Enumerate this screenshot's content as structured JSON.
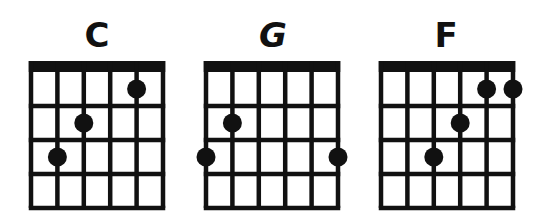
{
  "chords": [
    {
      "name": "C",
      "dots": [
        {
          "string": 4,
          "fret": 1
        },
        {
          "string": 2,
          "fret": 2
        },
        {
          "string": 1,
          "fret": 3
        }
      ]
    },
    {
      "name": "G",
      "dots": [
        {
          "string": 1,
          "fret": 2
        },
        {
          "string": 0,
          "fret": 3
        },
        {
          "string": 5,
          "fret": 3
        }
      ]
    },
    {
      "name": "F",
      "dots": [
        {
          "string": 4,
          "fret": 1
        },
        {
          "string": 5,
          "fret": 1
        },
        {
          "string": 3,
          "fret": 2
        },
        {
          "string": 2,
          "fret": 3
        }
      ]
    }
  ],
  "fretboard": {
    "strings": 6,
    "frets": 4
  },
  "colors": {
    "line": "#111111",
    "dot": "#111111",
    "background": "#ffffff"
  }
}
